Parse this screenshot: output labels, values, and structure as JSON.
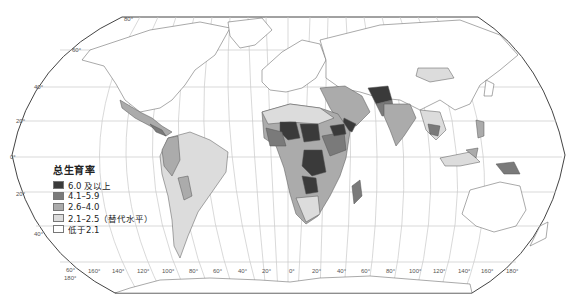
{
  "map": {
    "projection": "Robinson",
    "subject": "总生育率",
    "latitude_labels_left": [
      "80°",
      "60°",
      "40°",
      "20°",
      "0°",
      "20°",
      "40°",
      "60°"
    ],
    "longitude_labels_bottom": [
      "180°",
      "160°",
      "140°",
      "120°",
      "100°",
      "80°",
      "60°",
      "40°",
      "20°",
      "0°",
      "20°",
      "40°",
      "60°",
      "80°",
      "100°",
      "120°",
      "140°",
      "160°",
      "180°"
    ]
  },
  "legend": {
    "title": "总生育率",
    "items": [
      {
        "label": "6.0 及以上",
        "color": "#3a3a3a"
      },
      {
        "label": "4.1–5.9",
        "color": "#7a7a7a"
      },
      {
        "label": "2.6–4.0",
        "color": "#ababab"
      },
      {
        "label": "2.1–2.5（替代水平）",
        "color": "#dcdcdc"
      },
      {
        "label": "低于2.1",
        "color": "#ffffff"
      }
    ]
  },
  "labels": {
    "lat80": "80°",
    "lat60n": "60°",
    "lat40n": "40°",
    "lat20n": "20°",
    "lat0": "0°",
    "lat20s": "20°",
    "lat40s": "40°",
    "lat60s": "60°",
    "lon": [
      "180°",
      "160°",
      "140°",
      "120°",
      "100°",
      "80°",
      "60°",
      "40°",
      "20°",
      "0°",
      "20°",
      "40°",
      "60°",
      "80°",
      "100°",
      "120°",
      "140°",
      "160°",
      "180°"
    ]
  }
}
